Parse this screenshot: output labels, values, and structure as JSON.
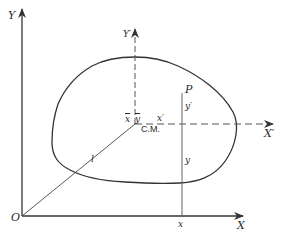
{
  "diagram": {
    "colors": {
      "stroke": "#333333",
      "dashed": "#555555",
      "background": "#ffffff"
    },
    "labels": {
      "y_axis": "Y",
      "x_axis": "X",
      "origin": "O",
      "y_prime_axis": "Y′",
      "x_prime_axis": "X′",
      "center_of_mass": "C.M.",
      "x_bar": "x",
      "y_bar": "y",
      "point": "P",
      "y_prime": "y′",
      "x_prime": "x′",
      "y_coord": "y",
      "x_coord": "x",
      "distance": "l"
    }
  }
}
